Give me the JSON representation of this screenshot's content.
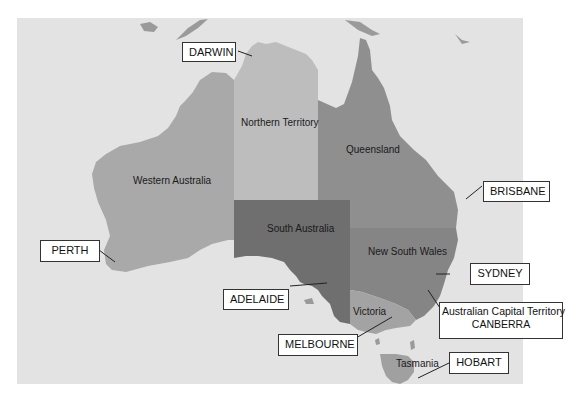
{
  "map": {
    "title": "Australia states and capitals",
    "colors": {
      "ocean": "#e3e3e3",
      "western_australia": "#a9a9a9",
      "northern_territory": "#bdbdbd",
      "queensland": "#8f8f8f",
      "south_australia": "#6f6f6f",
      "new_south_wales": "#858585",
      "victoria": "#a3a3a3",
      "tasmania": "#a0a0a0",
      "islands": "#9a9a9a"
    },
    "regions": [
      {
        "id": "western-australia",
        "label": "Western Australia"
      },
      {
        "id": "northern-territory",
        "label": "Northern Territory"
      },
      {
        "id": "queensland",
        "label": "Queensland"
      },
      {
        "id": "south-australia",
        "label": "South Australia"
      },
      {
        "id": "new-south-wales",
        "label": "New South Wales"
      },
      {
        "id": "victoria",
        "label": "Victoria"
      },
      {
        "id": "tasmania",
        "label": "Tasmania"
      }
    ],
    "cities": [
      {
        "id": "darwin",
        "label": "DARWIN"
      },
      {
        "id": "brisbane",
        "label": "BRISBANE"
      },
      {
        "id": "perth",
        "label": "PERTH"
      },
      {
        "id": "adelaide",
        "label": "ADELAIDE"
      },
      {
        "id": "sydney",
        "label": "SYDNEY"
      },
      {
        "id": "canberra",
        "label_line1": "Australian Capital Territory",
        "label_line2": "CANBERRA"
      },
      {
        "id": "melbourne",
        "label": "MELBOURNE"
      },
      {
        "id": "hobart",
        "label": "HOBART"
      }
    ]
  }
}
